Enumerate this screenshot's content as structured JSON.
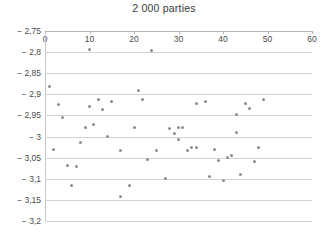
{
  "chart_data": {
    "type": "scatter",
    "title": "2 000 parties",
    "xlabel": "",
    "ylabel": "",
    "xlim": [
      0,
      60
    ],
    "ylim": [
      -3.2,
      -2.75
    ],
    "xticks": [
      0,
      10,
      20,
      30,
      40,
      50,
      60
    ],
    "yticks": [
      -2.75,
      -2.8,
      -2.85,
      -2.9,
      -2.95,
      -3,
      -3.05,
      -3.1,
      -3.15,
      -3.2
    ],
    "xtick_labels": [
      "0",
      "10",
      "20",
      "30",
      "40",
      "50",
      "60"
    ],
    "ytick_labels": [
      "− 2,75",
      "− 2,8",
      "− 2,85",
      "− 2,9",
      "− 2,95",
      "− 3",
      "− 3,05",
      "− 3,1",
      "− 3,15",
      "− 3,2"
    ],
    "grid": true,
    "grid_axis": "y",
    "x_axis_position": "top",
    "legend": null,
    "marker_color": "#8c8c96",
    "grid_color": "#d2d2d2",
    "series": [
      {
        "name": "parties",
        "points": [
          [
            1,
            -2.881
          ],
          [
            2,
            -3.031
          ],
          [
            3,
            -2.925
          ],
          [
            4,
            -2.956
          ],
          [
            5,
            -3.068
          ],
          [
            6,
            -3.115
          ],
          [
            7,
            -3.071
          ],
          [
            8,
            -3.015
          ],
          [
            9,
            -2.978
          ],
          [
            10,
            -2.794
          ],
          [
            10,
            -2.928
          ],
          [
            11,
            -2.972
          ],
          [
            12,
            -2.912
          ],
          [
            13,
            -2.936
          ],
          [
            14,
            -3.0
          ],
          [
            15,
            -2.918
          ],
          [
            17,
            -3.034
          ],
          [
            17,
            -3.141
          ],
          [
            19,
            -3.115
          ],
          [
            20,
            -2.978
          ],
          [
            21,
            -2.891
          ],
          [
            22,
            -2.913
          ],
          [
            23,
            -3.055
          ],
          [
            24,
            -2.797
          ],
          [
            25,
            -3.032
          ],
          [
            27,
            -3.1
          ],
          [
            28,
            -2.981
          ],
          [
            29,
            -2.992
          ],
          [
            30,
            -2.979
          ],
          [
            30,
            -3.008
          ],
          [
            31,
            -2.978
          ],
          [
            32,
            -3.032
          ],
          [
            33,
            -3.027
          ],
          [
            34,
            -3.027
          ],
          [
            34,
            -2.922
          ],
          [
            36,
            -2.917
          ],
          [
            37,
            -3.094
          ],
          [
            38,
            -3.031
          ],
          [
            39,
            -3.057
          ],
          [
            40,
            -3.105
          ],
          [
            41,
            -3.049
          ],
          [
            42,
            -3.045
          ],
          [
            43,
            -2.948
          ],
          [
            43,
            -2.991
          ],
          [
            44,
            -3.091
          ],
          [
            45,
            -2.921
          ],
          [
            46,
            -2.933
          ],
          [
            47,
            -3.059
          ],
          [
            48,
            -3.027
          ],
          [
            49,
            -2.912
          ]
        ]
      }
    ]
  }
}
